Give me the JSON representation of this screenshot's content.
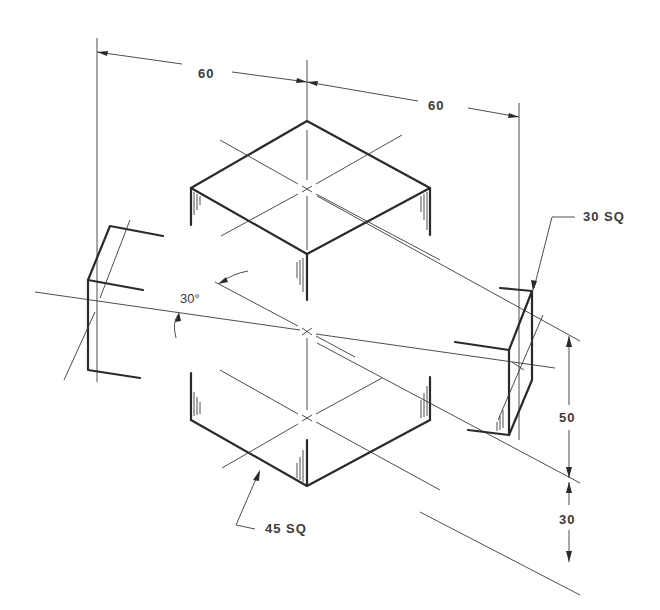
{
  "drawing": {
    "title": "Isometric view with dimensions",
    "colors": {
      "line": "#2a2a2a",
      "background": "#ffffff"
    }
  },
  "dimensions": {
    "top_left_width": "60",
    "top_right_width": "60",
    "right_height_upper": "50",
    "right_height_lower": "30",
    "angle": "30°",
    "small_square_note": "30 SQ",
    "large_square_note": "45 SQ"
  }
}
